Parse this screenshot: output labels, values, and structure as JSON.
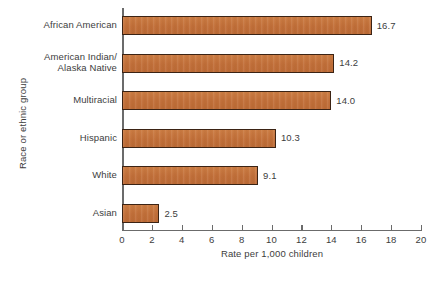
{
  "chart_data": {
    "type": "bar",
    "orientation": "horizontal",
    "title": "",
    "xlabel": "Rate per 1,000 children",
    "ylabel": "Race or ethnic group",
    "xlim": [
      0,
      20
    ],
    "xticks": [
      0,
      2,
      4,
      6,
      8,
      10,
      12,
      14,
      16,
      18,
      20
    ],
    "xtick_labels": [
      "0",
      "2",
      "4",
      "6",
      "8",
      "10",
      "12",
      "14",
      "16",
      "18",
      "20"
    ],
    "grid": false,
    "legend": null,
    "bar_color": "#c2703a",
    "bar_edge_color": "#3b2314",
    "axis_color": "#6b6b6b",
    "background": "#ffffff",
    "categories": [
      "African American",
      "American Indian/ Alaska Native",
      "Multiracial",
      "Hispanic",
      "White",
      "Asian"
    ],
    "category_lines": [
      [
        "African American"
      ],
      [
        "American Indian/",
        "Alaska Native"
      ],
      [
        "Multiracial"
      ],
      [
        "Hispanic"
      ],
      [
        "White"
      ],
      [
        "Asian"
      ]
    ],
    "values": [
      16.7,
      14.2,
      14.0,
      10.3,
      9.1,
      2.5
    ],
    "value_labels": [
      "16.7",
      "14.2",
      "14.0",
      "10.3",
      "9.1",
      "2.5"
    ]
  },
  "axis": {
    "x_title": "Rate per 1,000 children",
    "y_title": "Race or ethnic group"
  }
}
